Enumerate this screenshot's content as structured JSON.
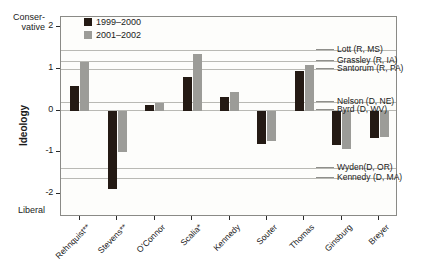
{
  "chart_data": {
    "type": "bar",
    "title": "",
    "xlabel": "",
    "ylabel": "Ideology",
    "ylim": [
      -2.55,
      2.25
    ],
    "yticks": [
      2,
      1,
      0,
      -1,
      -2
    ],
    "ytick_labels": [
      "2",
      "1",
      "0",
      "-1",
      "-2"
    ],
    "axis_high_label": "Conser-\nvative",
    "axis_high_label_line1": "Conser-",
    "axis_high_label_line2": "vative",
    "axis_low_label": "Liberal",
    "grid": false,
    "legend_position": "top-center-left",
    "categories": [
      "Rehnquist**",
      "Stevens**",
      "O'Connor",
      "Scalia*",
      "Kennedy",
      "Souter",
      "Thomas",
      "Ginsburg",
      "Breyer"
    ],
    "series": [
      {
        "name": "1999–2000",
        "color": "#241a14",
        "values": [
          0.6,
          -1.88,
          0.15,
          0.8,
          0.33,
          -0.8,
          0.95,
          -0.82,
          -0.65
        ]
      },
      {
        "name": "2001–2002",
        "color": "#9c9c98",
        "values": [
          1.18,
          -1.0,
          0.19,
          1.37,
          0.45,
          -0.72,
          1.1,
          -0.92,
          -0.62
        ]
      }
    ],
    "reference_lines": [
      {
        "label": "Lott (R, MS)",
        "value": 1.45
      },
      {
        "label": "Grassley (R, IA)",
        "value": 1.2
      },
      {
        "label": "Santorum (R, PA)",
        "value": 1.0
      },
      {
        "label": "Nelson (D, NE)",
        "value": 0.22
      },
      {
        "label": "Byrd (D, WV)",
        "value": 0.02
      },
      {
        "label": "Wyden(D, OR)",
        "value": -1.38
      },
      {
        "label": "Kennedy (D, MA)",
        "value": -1.62
      }
    ]
  }
}
